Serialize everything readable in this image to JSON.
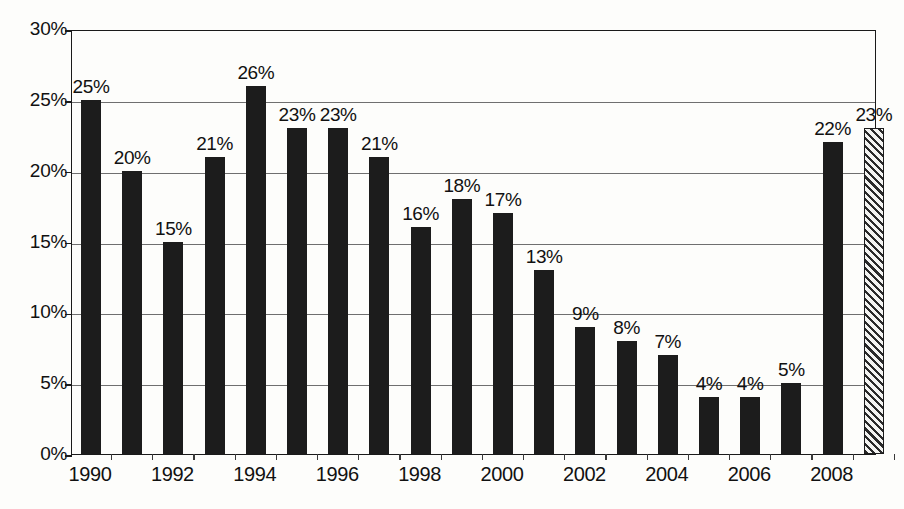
{
  "chart_data": {
    "type": "bar",
    "title": "",
    "subtitle": "",
    "xlabel": "",
    "ylabel": "",
    "ylim": [
      0,
      30
    ],
    "ytick_step": 5,
    "grid": true,
    "legend": "none",
    "categories": [
      "1990",
      "1991",
      "1992",
      "1993",
      "1994",
      "1995",
      "1996",
      "1997",
      "1998",
      "1999",
      "2000",
      "2001",
      "2002",
      "2003",
      "2004",
      "2005",
      "2006",
      "2007",
      "2008",
      "2009"
    ],
    "values": [
      25,
      20,
      15,
      21,
      26,
      23,
      23,
      21,
      16,
      18,
      17,
      13,
      9,
      8,
      7,
      4,
      4,
      5,
      22,
      23
    ],
    "data_labels": [
      "25%",
      "20%",
      "15%",
      "21%",
      "26%",
      "23%",
      "23%",
      "21%",
      "16%",
      "18%",
      "17%",
      "13%",
      "9%",
      "8%",
      "7%",
      "4%",
      "4%",
      "5%",
      "22%",
      "23%"
    ],
    "bar_styles": [
      "solid",
      "solid",
      "solid",
      "solid",
      "solid",
      "solid",
      "solid",
      "solid",
      "solid",
      "solid",
      "solid",
      "solid",
      "solid",
      "solid",
      "solid",
      "solid",
      "solid",
      "solid",
      "solid",
      "hatched"
    ],
    "ytick_labels": [
      "0%",
      "5%",
      "10%",
      "15%",
      "20%",
      "25%",
      "30%"
    ],
    "ytick_values": [
      0,
      5,
      10,
      15,
      20,
      25,
      30
    ],
    "xtick_labels": [
      {
        "label": "1990",
        "index": 0
      },
      {
        "label": "1992",
        "index": 2
      },
      {
        "label": "1994",
        "index": 4
      },
      {
        "label": "1996",
        "index": 6
      },
      {
        "label": "1998",
        "index": 8
      },
      {
        "label": "2000",
        "index": 10
      },
      {
        "label": "2002",
        "index": 12
      },
      {
        "label": "2004",
        "index": 14
      },
      {
        "label": "2006",
        "index": 16
      },
      {
        "label": "2008",
        "index": 18
      }
    ],
    "colors": {
      "bar_solid": "#1c1c1c",
      "bar_hatch_line": "#2a2a2a",
      "bar_hatch_background": "#f4f4f2",
      "gridline": "#6f6f6f",
      "axis": "#1a1a1a",
      "text": "#111111",
      "background": "#fdfdfb"
    }
  }
}
